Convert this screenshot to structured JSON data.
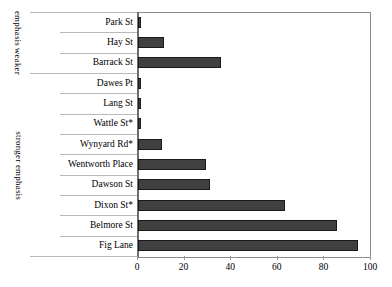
{
  "chart_data": {
    "type": "bar",
    "orientation": "horizontal",
    "title": "",
    "xlabel": "",
    "ylabel": "",
    "xlim": [
      0,
      100
    ],
    "xticks": [
      0,
      20,
      40,
      60,
      80,
      100
    ],
    "grid": false,
    "legend": null,
    "bar_color": "#404040",
    "bar_edge_color": "#1a1a1a",
    "categories": [
      "Park St",
      "Hay St",
      "Barrack St",
      "Dawes Pt",
      "Lang St",
      "Wattle St*",
      "Wynyard Rd*",
      "Wentworth Place",
      "Dawson St",
      "Dixon St*",
      "Belmore St",
      "Fig Lane"
    ],
    "values": [
      1.5,
      11,
      35.5,
      1.5,
      1.5,
      1.5,
      10.5,
      29,
      31,
      63,
      85.5,
      94.5
    ],
    "group_labels": [
      {
        "text_lines": [
          "weaker",
          "emphasis"
        ],
        "categories": [
          "Park St",
          "Hay St",
          "Barrack St"
        ]
      },
      {
        "text_lines": [
          "stronger emphasis"
        ],
        "categories": [
          "Dawes Pt",
          "Lang St",
          "Wattle St*",
          "Wynyard Rd*",
          "Wentworth Place",
          "Dawson St",
          "Dixon St*",
          "Belmore St",
          "Fig Lane"
        ]
      }
    ],
    "annotations": [
      "* denotes starred street names"
    ]
  }
}
